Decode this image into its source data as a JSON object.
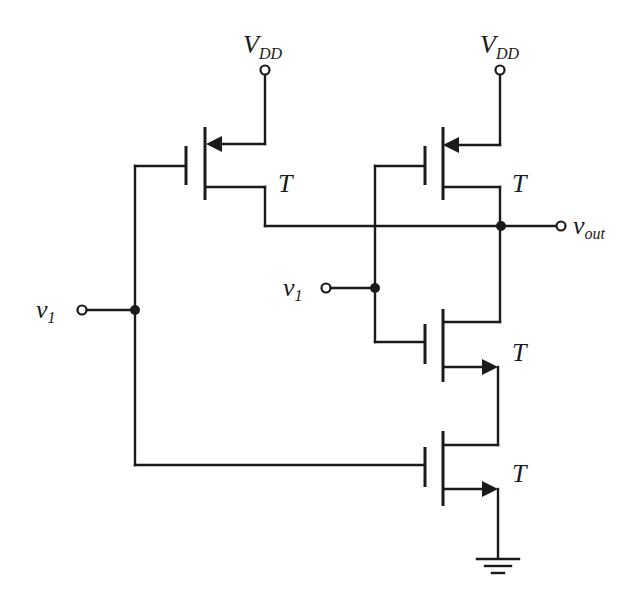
{
  "diagram": {
    "type": "circuit-schematic",
    "labels": {
      "vdd_left": {
        "main": "V",
        "sub": "DD"
      },
      "vdd_right": {
        "main": "V",
        "sub": "DD"
      },
      "v1_left": {
        "main": "v",
        "sub": "1"
      },
      "v1_right": {
        "main": "v",
        "sub": "1"
      },
      "vout": {
        "main": "v",
        "sub": "out"
      },
      "t_pmos_left": "T",
      "t_pmos_right": "T",
      "t_nmos_top": "T",
      "t_nmos_bottom": "T"
    },
    "components": [
      {
        "id": "pmos-left",
        "kind": "PMOS",
        "label": "T"
      },
      {
        "id": "pmos-right",
        "kind": "PMOS",
        "label": "T"
      },
      {
        "id": "nmos-top",
        "kind": "NMOS",
        "label": "T"
      },
      {
        "id": "nmos-bottom",
        "kind": "NMOS",
        "label": "T"
      },
      {
        "id": "ground",
        "kind": "ground"
      }
    ],
    "colors": {
      "ink": "#1a1a1a",
      "background": "#ffffff"
    }
  }
}
